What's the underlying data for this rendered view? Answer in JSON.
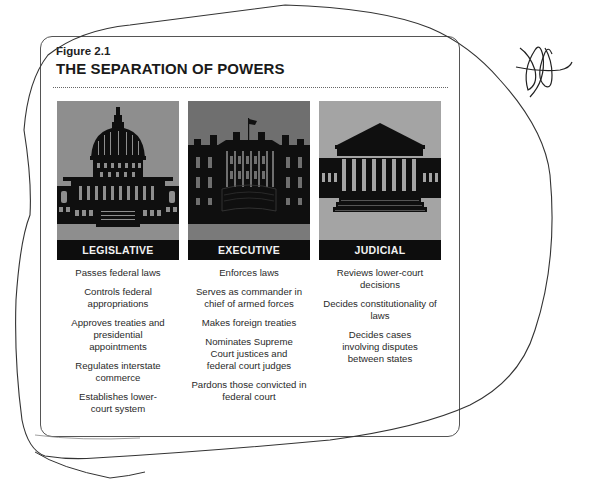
{
  "figure": {
    "label": "Figure 2.1",
    "title": "THE SEPARATION OF POWERS"
  },
  "colors": {
    "legislative_bg": "#8e8e8e",
    "executive_bg": "#6f6f6f",
    "judicial_bg": "#a4a4a4",
    "label_bar": "#0d0d0d",
    "label_text": "#f2f2f2",
    "frame": "#555555"
  },
  "branches": [
    {
      "name": "LEGISLATIVE",
      "icon": "capitol-building-icon",
      "powers": [
        "Passes federal laws",
        "Controls federal appropriations",
        "Approves treaties and presidential appointments",
        "Regulates interstate commerce",
        "Establishes lower-court system"
      ]
    },
    {
      "name": "EXECUTIVE",
      "icon": "white-house-icon",
      "powers": [
        "Enforces laws",
        "Serves as commander in chief of armed forces",
        "Makes foreign treaties",
        "Nominates Supreme Court justices and federal court judges",
        "Pardons those convicted in federal court"
      ]
    },
    {
      "name": "JUDICIAL",
      "icon": "supreme-court-icon",
      "powers": [
        "Reviews lower-court decisions",
        "Decides constitutionality of laws",
        "Decides cases involving disputes between states"
      ]
    }
  ],
  "annotations": {
    "pen_loop": "hand-drawn-loop",
    "signature": "handwritten-initials"
  }
}
